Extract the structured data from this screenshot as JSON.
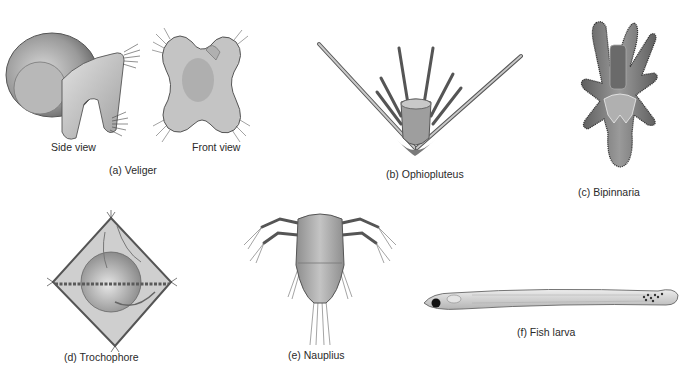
{
  "figure": {
    "panels": [
      {
        "id": "a",
        "letter": "(a)",
        "name": "Veliger",
        "caption": "(a)   Veliger",
        "sublabels": {
          "side": "Side view",
          "front": "Front view"
        }
      },
      {
        "id": "b",
        "letter": "(b)",
        "name": "Ophiopluteus",
        "caption": "(b)   Ophiopluteus"
      },
      {
        "id": "c",
        "letter": "(c)",
        "name": "Bipinnaria",
        "caption": "(c)   Bipinnaria"
      },
      {
        "id": "d",
        "letter": "(d)",
        "name": "Trochophore",
        "caption": "(d)   Trochophore"
      },
      {
        "id": "e",
        "letter": "(e)",
        "name": "Nauplius",
        "caption": "(e)   Nauplius"
      },
      {
        "id": "f",
        "letter": "(f)",
        "name": "Fish larva",
        "caption": "(f)   Fish larva"
      }
    ]
  },
  "colors": {
    "body_light": "#d9d9d9",
    "body_mid": "#a8a8a8",
    "body_dark": "#6e6e6e",
    "outline": "#4a4a4a",
    "background": "#ffffff"
  }
}
